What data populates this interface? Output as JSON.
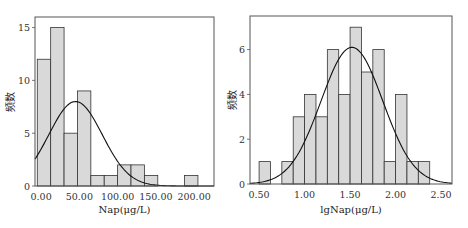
{
  "chart_data": [
    {
      "type": "bar",
      "title": "",
      "xlabel": "Nap(μg/L)",
      "ylabel": "频数",
      "xlim": [
        -8,
        226
      ],
      "ylim": [
        0,
        16
      ],
      "xticks": [
        0,
        50,
        100,
        150,
        200
      ],
      "xtick_labels": [
        "0.00",
        "50.00",
        "100.00",
        "150.00",
        "200.00"
      ],
      "yticks": [
        0,
        5,
        10,
        15
      ],
      "ytick_labels": [
        "0",
        "5",
        "10",
        "15"
      ],
      "bin_edges": [
        -5,
        12.5,
        30,
        47.5,
        65,
        82.5,
        100,
        117.5,
        135,
        152.5,
        170,
        187.5,
        205
      ],
      "values": [
        12,
        15,
        5,
        9,
        1,
        1,
        2,
        2,
        1,
        0,
        0,
        1
      ],
      "normal_curve": {
        "mean": 45,
        "sd": 35,
        "peak": 8
      },
      "grid": false,
      "legend": "none"
    },
    {
      "type": "bar",
      "title": "",
      "xlabel": "lgNap(μg/L)",
      "ylabel": "频数",
      "xlim": [
        0.4,
        2.62
      ],
      "ylim": [
        0,
        7.5
      ],
      "xticks": [
        0.5,
        1.0,
        1.5,
        2.0,
        2.5
      ],
      "xtick_labels": [
        "0.50",
        "1.00",
        "1.50",
        "2.00",
        "2.50"
      ],
      "yticks": [
        0,
        2,
        4,
        6
      ],
      "ytick_labels": [
        "0",
        "2",
        "4",
        "6"
      ],
      "bin_edges": [
        0.5,
        0.625,
        0.75,
        0.875,
        1.0,
        1.125,
        1.25,
        1.375,
        1.5,
        1.625,
        1.75,
        1.875,
        2.0,
        2.125,
        2.25,
        2.375
      ],
      "values": [
        1,
        0,
        1,
        3,
        4,
        3,
        6,
        4,
        7,
        5,
        6,
        1,
        4,
        1,
        1
      ],
      "normal_curve": {
        "mean": 1.52,
        "sd": 0.34,
        "peak": 6.1
      },
      "grid": false,
      "legend": "none"
    }
  ]
}
